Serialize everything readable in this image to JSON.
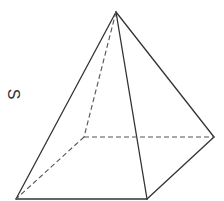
{
  "figure": {
    "type": "square-pyramid",
    "label": "S",
    "label_rotation_deg": 90,
    "stroke_color": "#333333",
    "dashed_color": "#555555",
    "vertices": {
      "apex": [
        116,
        12
      ],
      "front_left": [
        16,
        199
      ],
      "front_right": [
        147,
        199
      ],
      "back_right": [
        214,
        137
      ],
      "back_left": [
        84,
        137
      ]
    },
    "solid_edges": [
      [
        "apex",
        "front_left"
      ],
      [
        "apex",
        "front_right"
      ],
      [
        "apex",
        "back_right"
      ],
      [
        "front_left",
        "front_right"
      ],
      [
        "front_right",
        "back_right"
      ]
    ],
    "hidden_edges": [
      [
        "apex",
        "back_left"
      ],
      [
        "back_left",
        "front_left"
      ],
      [
        "back_left",
        "back_right"
      ]
    ]
  }
}
